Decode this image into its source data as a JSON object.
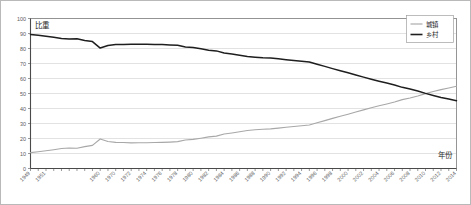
{
  "chart_data": {
    "type": "line",
    "title": "",
    "xlabel": "年份",
    "ylabel": "比重",
    "ylim": [
      0,
      100
    ],
    "ytick_step": 10,
    "yticks": [
      "0",
      "10",
      "20",
      "30",
      "40",
      "50",
      "60",
      "70",
      "80",
      "90",
      "100"
    ],
    "grid": true,
    "legend_position": "top-right",
    "categories": [
      "1949",
      "1950",
      "1951",
      "1952",
      "1953",
      "1954",
      "1955",
      "1956",
      "1957",
      "1960",
      "1965",
      "1970",
      "1971",
      "1972",
      "1973",
      "1974",
      "1975",
      "1976",
      "1977",
      "1978",
      "1979",
      "1980",
      "1981",
      "1982",
      "1983",
      "1984",
      "1985",
      "1986",
      "1987",
      "1988",
      "1989",
      "1990",
      "1991",
      "1992",
      "1993",
      "1994",
      "1995",
      "1996",
      "1997",
      "1998",
      "1999",
      "2000",
      "2001",
      "2002",
      "2003",
      "2004",
      "2005",
      "2006",
      "2007",
      "2008",
      "2009",
      "2010",
      "2011",
      "2012",
      "2013",
      "2014"
    ],
    "xtick_labels": [
      "1949",
      "1951",
      "1960",
      "1970",
      "1972",
      "1974",
      "1976",
      "1978",
      "1980",
      "1982",
      "1984",
      "1986",
      "1988",
      "1990",
      "1992",
      "1994",
      "1996",
      "1998",
      "2000",
      "2002",
      "2004",
      "2006",
      "2008",
      "2010",
      "2012",
      "2014"
    ],
    "series": [
      {
        "name": "城镇",
        "color": "#a8a8a8",
        "values": [
          10.6,
          11.2,
          11.8,
          12.5,
          13.3,
          13.7,
          13.5,
          14.6,
          15.4,
          19.7,
          18.0,
          17.4,
          17.3,
          17.1,
          17.2,
          17.2,
          17.3,
          17.4,
          17.6,
          17.9,
          19.0,
          19.4,
          20.2,
          21.1,
          21.6,
          23.0,
          23.7,
          24.5,
          25.3,
          25.8,
          26.2,
          26.4,
          26.9,
          27.5,
          28.0,
          28.5,
          29.0,
          30.5,
          31.9,
          33.4,
          34.8,
          36.2,
          37.7,
          39.1,
          40.5,
          41.8,
          43.0,
          44.3,
          45.9,
          47.0,
          48.3,
          49.9,
          51.3,
          52.6,
          53.7,
          54.8
        ]
      },
      {
        "name": "乡村",
        "color": "#1e1e1e",
        "values": [
          89.4,
          88.8,
          88.2,
          87.5,
          86.7,
          86.3,
          86.5,
          85.4,
          84.6,
          80.3,
          82.0,
          82.6,
          82.7,
          82.9,
          82.8,
          82.8,
          82.7,
          82.6,
          82.4,
          82.1,
          81.0,
          80.6,
          79.8,
          78.9,
          78.4,
          77.0,
          76.3,
          75.5,
          74.7,
          74.2,
          73.8,
          73.6,
          73.1,
          72.5,
          72.0,
          71.5,
          71.0,
          69.5,
          68.1,
          66.6,
          65.2,
          63.8,
          62.3,
          60.9,
          59.5,
          58.2,
          57.0,
          55.7,
          54.1,
          53.0,
          51.7,
          50.1,
          48.7,
          47.4,
          46.3,
          45.2
        ]
      }
    ]
  },
  "legend": {
    "items": [
      {
        "label": "城镇",
        "color": "#a8a8a8"
      },
      {
        "label": "乡村",
        "color": "#1e1e1e"
      }
    ]
  },
  "labels": {
    "y_axis_title": "比重",
    "x_axis_title": "年份"
  }
}
